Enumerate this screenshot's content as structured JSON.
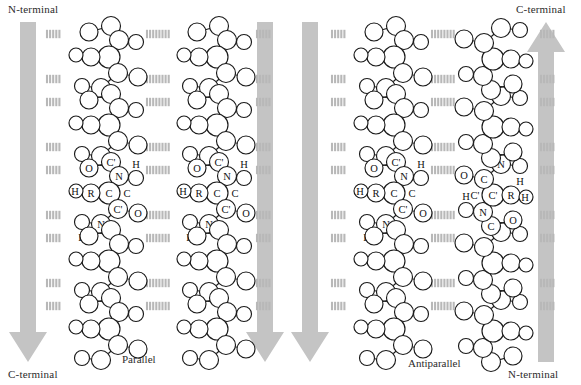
{
  "figure": {
    "background": "#ffffff",
    "arrow_color": "#c4c4c4",
    "hbond_color": "#b8b8b8",
    "atom_stroke": "#1a1a1a",
    "atom_fill": "#ffffff"
  },
  "panels": [
    {
      "id": "parallel",
      "caption": "Parallel",
      "caption_x": 150,
      "caption_y": 361,
      "top_label": {
        "text": "N-terminal",
        "x": 8,
        "y": 3
      },
      "bottom_label": {
        "text": "C-terminal",
        "x": 8,
        "y": 368
      },
      "arrows": [
        {
          "id": "parallel-left-arrow",
          "direction": "down",
          "x": 28,
          "y_top": 22,
          "y_bottom": 362
        },
        {
          "id": "parallel-right-arrow",
          "direction": "down",
          "x": 265,
          "y_top": 22,
          "y_bottom": 362
        }
      ],
      "strands": [
        {
          "id": "parallel-strand-1",
          "direction": "down",
          "x": 105,
          "mirrored": false
        },
        {
          "id": "parallel-strand-2",
          "direction": "down",
          "x": 213,
          "mirrored": false
        }
      ]
    },
    {
      "id": "antiparallel",
      "caption": "Antiparallel",
      "caption_x": 437,
      "caption_y": 357,
      "top_label": {
        "text": "C-terminal",
        "x": 524,
        "y": 3
      },
      "bottom_label": {
        "text": "N-terminal",
        "x": 518,
        "y": 368
      },
      "arrows": [
        {
          "id": "antiparallel-left-arrow",
          "direction": "down",
          "x": 310,
          "y_top": 22,
          "y_bottom": 362
        },
        {
          "id": "antiparallel-right-arrow",
          "direction": "up",
          "x": 546,
          "y_top": 22,
          "y_bottom": 362
        }
      ],
      "strands": [
        {
          "id": "antiparallel-strand-1",
          "direction": "down",
          "x": 390,
          "mirrored": false
        },
        {
          "id": "antiparallel-strand-2",
          "direction": "up",
          "x": 497,
          "mirrored": true
        }
      ]
    }
  ],
  "atom_labels": {
    "carbonyl_oxygen": "O",
    "carbonyl_carbon": "C'",
    "amide_nitrogen": "N",
    "amide_hydrogen": "H",
    "alpha_carbon": "C",
    "side_chain": "R",
    "alpha_hydrogen": "H"
  },
  "labeled_units": [
    {
      "strand": "parallel-strand-1",
      "labels": [
        "O",
        "C'",
        "N",
        "H",
        "H",
        "R",
        "C",
        "C'",
        "O",
        "N",
        "H"
      ]
    },
    {
      "strand": "parallel-strand-2",
      "labels": [
        "O",
        "C'",
        "N",
        "H",
        "H",
        "R",
        "C",
        "C'",
        "O",
        "N",
        "H"
      ]
    },
    {
      "strand": "antiparallel-strand-1",
      "labels": [
        "O",
        "C'",
        "N",
        "H",
        "H",
        "R",
        "C",
        "C'",
        "O",
        "N",
        "H"
      ]
    },
    {
      "strand": "antiparallel-strand-2",
      "labels": [
        "O",
        "C",
        "N",
        "H",
        "C'",
        "R",
        "H",
        "N",
        "H",
        "C",
        "O"
      ]
    }
  ],
  "hydrogen_bonds": {
    "label": "hydrogen bond",
    "style": "hatched",
    "rows_per_panel": 5
  }
}
